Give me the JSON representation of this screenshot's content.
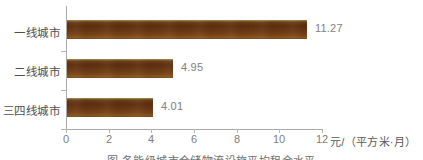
{
  "chart_data": {
    "type": "bar",
    "orientation": "horizontal",
    "title": "",
    "categories": [
      "一线城市",
      "二线城市",
      "三四线城市"
    ],
    "values": [
      11.27,
      4.95,
      4.01
    ],
    "value_labels": [
      "11.27",
      "4.95",
      "4.01"
    ],
    "xlabel": "元/（平方米·月）",
    "ylabel": "",
    "xlim": [
      0,
      12
    ],
    "xticks": [
      0,
      2,
      4,
      6,
      8,
      10,
      12
    ],
    "xtick_labels": [
      "0",
      "2",
      "4",
      "6",
      "8",
      "10",
      "12"
    ],
    "grid": false,
    "legend": false,
    "series": [
      {
        "name": "租金",
        "values": [
          11.27,
          4.95,
          4.01
        ],
        "color": "#6d3d17"
      }
    ]
  },
  "axis": {
    "unit_label": "元/（平方米·月）"
  },
  "caption": {
    "text": "图        各能级城市仓储物流设施平均租金水平"
  },
  "colors": {
    "bar": "#6d3d17",
    "bar_highlight": "#8a7238",
    "axis": "#a9a9a9",
    "value_text": "#808080",
    "category_text": "#4f4f4f",
    "tick_text": "#7d7d7d"
  }
}
